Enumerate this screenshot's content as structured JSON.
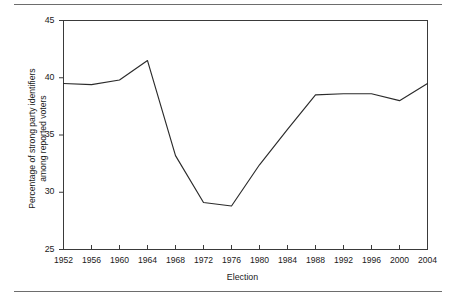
{
  "figure": {
    "background_color": "#ffffff",
    "line_color": "#2b2b2b",
    "axis_color": "#3a3a3a",
    "rule_color": "#6d6d6d",
    "top_rule": "",
    "bottom_rule": ""
  },
  "chart_data": {
    "type": "line",
    "title": "",
    "xlabel": "Election",
    "ylabel": "Percentage of strong party identifiers\namong reported voters",
    "ylabel_line1": "Percentage of strong party identifiers",
    "ylabel_line2": "among reported voters",
    "categories": [
      "1952",
      "1956",
      "1960",
      "1964",
      "1968",
      "1972",
      "1976",
      "1980",
      "1984",
      "1988",
      "1992",
      "1996",
      "2000",
      "2004"
    ],
    "x": [
      1952,
      1956,
      1960,
      1964,
      1968,
      1972,
      1976,
      1980,
      1984,
      1988,
      1992,
      1996,
      2000,
      2004
    ],
    "values": [
      39.5,
      39.4,
      39.8,
      41.5,
      33.2,
      29.1,
      28.8,
      32.4,
      35.5,
      38.5,
      38.6,
      38.6,
      38.0,
      39.5
    ],
    "series": [
      {
        "name": "Strong party identifiers",
        "values": [
          39.5,
          39.4,
          39.8,
          41.5,
          33.2,
          29.1,
          28.8,
          32.4,
          35.5,
          38.5,
          38.6,
          38.6,
          38.0,
          39.5
        ]
      }
    ],
    "ylim": [
      25,
      45
    ],
    "xlim": [
      1952,
      2004
    ],
    "yticks": [
      25,
      30,
      35,
      40,
      45
    ],
    "ytick_labels": [
      "25",
      "30",
      "35",
      "40",
      "45"
    ],
    "xticks": [
      1952,
      1956,
      1960,
      1964,
      1968,
      1972,
      1976,
      1980,
      1984,
      1988,
      1992,
      1996,
      2000,
      2004
    ],
    "grid": false,
    "legend": null,
    "legend_position": "none",
    "marker": "none",
    "line_width": 1
  }
}
